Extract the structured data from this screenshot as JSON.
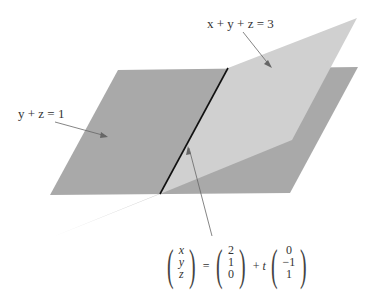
{
  "diagram": {
    "title": "",
    "planes": [
      {
        "id": "plane-1",
        "equation": "y + z = 1",
        "color": "#a7a7a7"
      },
      {
        "id": "plane-2",
        "equation": "x + y + z = 3",
        "color": "#cfcfcf"
      }
    ],
    "intersection_line": {
      "label": "line of intersection",
      "vector_equation": {
        "lhs": [
          "x",
          "y",
          "z"
        ],
        "equals": "=",
        "point": [
          "2",
          "1",
          "0"
        ],
        "plus": "+",
        "param": "t",
        "direction": [
          "0",
          "−1",
          "1"
        ]
      },
      "color": "#111111"
    },
    "labels": {
      "plane_1": "y + z = 1",
      "plane_2": "x + y + z = 3"
    }
  }
}
